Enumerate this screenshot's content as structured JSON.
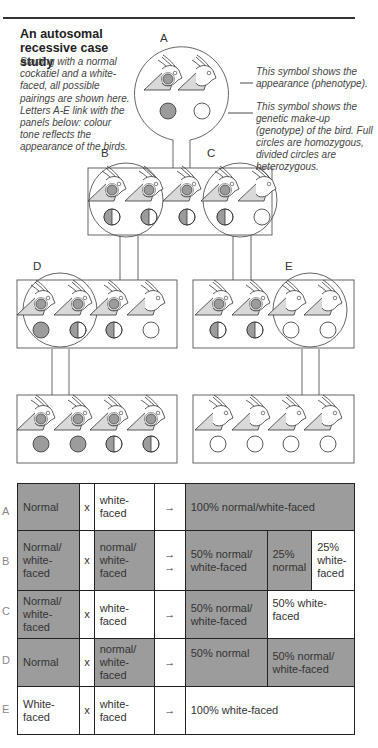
{
  "header": {
    "title": "An autosomal recessive case study",
    "intro": "Starting with a normal cockatiel and a white-faced, all possible pairings are shown here. Letters A-E link with the panels below: colour tone reflects the appearance of the birds."
  },
  "annotations": {
    "phenotype_note": "This symbol shows the appearance (phenotype).",
    "genotype_note": "This symbol shows the genetic make-up (genotype) of the bird. Full circles are homozygous, divided circles are heterozygous."
  },
  "colors": {
    "normal_fill": "#9c9c9c",
    "bird_fill": "#d9d9d9",
    "line": "#333333"
  },
  "panels": {
    "A": {
      "label": "A",
      "birds": [
        {
          "phenotype": "normal",
          "genotype": "full-grey"
        },
        {
          "phenotype": "white-faced",
          "genotype": "full-white"
        }
      ]
    },
    "B": {
      "label": "B"
    },
    "C": {
      "label": "C"
    },
    "D": {
      "label": "D"
    },
    "E": {
      "label": "E"
    },
    "BC_row": [
      {
        "phenotype": "normal",
        "genotype": "split"
      },
      {
        "phenotype": "normal",
        "genotype": "split"
      },
      {
        "phenotype": "normal",
        "genotype": "split"
      },
      {
        "phenotype": "normal",
        "genotype": "split"
      },
      {
        "phenotype": "white-faced",
        "genotype": "full-white"
      }
    ],
    "D_row": [
      {
        "phenotype": "normal",
        "genotype": "full-grey"
      },
      {
        "phenotype": "normal",
        "genotype": "split"
      },
      {
        "phenotype": "normal",
        "genotype": "split"
      },
      {
        "phenotype": "white-faced",
        "genotype": "full-white"
      }
    ],
    "E_row": [
      {
        "phenotype": "normal",
        "genotype": "split"
      },
      {
        "phenotype": "normal",
        "genotype": "split"
      },
      {
        "phenotype": "white-faced",
        "genotype": "full-white"
      },
      {
        "phenotype": "white-faced",
        "genotype": "full-white"
      }
    ],
    "D_offspring": [
      {
        "phenotype": "normal",
        "genotype": "full-grey"
      },
      {
        "phenotype": "normal",
        "genotype": "full-grey"
      },
      {
        "phenotype": "normal",
        "genotype": "split"
      },
      {
        "phenotype": "normal",
        "genotype": "split"
      }
    ],
    "E_offspring": [
      {
        "phenotype": "white-faced",
        "genotype": "full-white"
      },
      {
        "phenotype": "white-faced",
        "genotype": "full-white"
      },
      {
        "phenotype": "white-faced",
        "genotype": "full-white"
      },
      {
        "phenotype": "white-faced",
        "genotype": "full-white"
      }
    ]
  },
  "table": {
    "rows": [
      {
        "label": "A",
        "parent1": "Normal",
        "cross": "x",
        "parent2": "white-faced",
        "arrow": "→",
        "results": [
          "100% normal/white-faced"
        ]
      },
      {
        "label": "B",
        "parent1": "Normal/ white-faced",
        "cross": "x",
        "parent2": "normal/ white-faced",
        "arrow": "→ →",
        "results": [
          "50% normal/ white-faced",
          "25% normal",
          "25% white-faced"
        ]
      },
      {
        "label": "C",
        "parent1": "Normal/ white-faced",
        "cross": "x",
        "parent2": "white-faced",
        "arrow": "→",
        "results": [
          "50% normal/ white-faced",
          "50% white-faced"
        ]
      },
      {
        "label": "D",
        "parent1": "Normal",
        "cross": "x",
        "parent2": "normal/ white-faced",
        "arrow": "→",
        "results": [
          "50% normal",
          "50% normal/ white-faced"
        ]
      },
      {
        "label": "E",
        "parent1": "White-faced",
        "cross": "x",
        "parent2": "white-faced",
        "arrow": "→",
        "results": [
          "100% white-faced"
        ]
      }
    ]
  }
}
